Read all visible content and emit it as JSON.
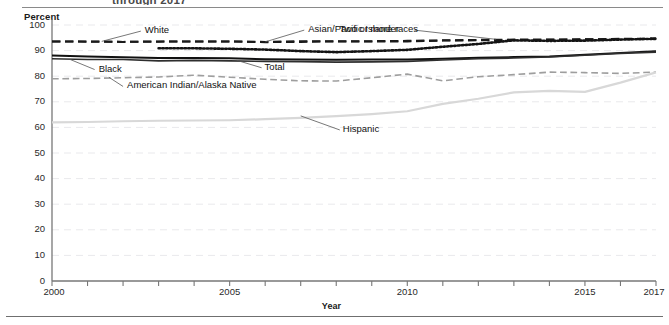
{
  "figure": {
    "title_partial": "through 2017",
    "top_rule": "horizontal-rule",
    "bottom_rule": "horizontal-rule"
  },
  "chart_data": {
    "type": "line",
    "title": "through 2017",
    "xlabel": "Year",
    "ylabel": "Percent",
    "ylim": [
      0,
      100
    ],
    "xlim": [
      2000,
      2017
    ],
    "ytick_labels": [
      "0",
      "10",
      "20",
      "30",
      "40",
      "50",
      "60",
      "70",
      "80",
      "90",
      "100"
    ],
    "ytick_values": [
      0,
      10,
      20,
      30,
      40,
      50,
      60,
      70,
      80,
      90,
      100
    ],
    "xtick_labels": [
      "2000",
      "2005",
      "2010",
      "2015",
      "2017"
    ],
    "xtick_values": [
      2000,
      2005,
      2010,
      2015,
      2017
    ],
    "x_minor_ticks": [
      2000,
      2001,
      2002,
      2003,
      2004,
      2005,
      2006,
      2007,
      2008,
      2009,
      2010,
      2011,
      2012,
      2013,
      2014,
      2015,
      2016,
      2017
    ],
    "grid": "horizontal-dashed-light",
    "legend_position": "inline-labels-with-leader-lines",
    "x": [
      2000,
      2001,
      2002,
      2003,
      2004,
      2005,
      2006,
      2007,
      2008,
      2009,
      2010,
      2011,
      2012,
      2013,
      2014,
      2015,
      2016,
      2017
    ],
    "series": [
      {
        "name": "Total",
        "style": "solid",
        "color": "#111111",
        "width": 1.9,
        "label_x": 2005.9,
        "label_y": 83.3,
        "leader_to": [
          2005.2,
          86.2
        ],
        "values": [
          88.1,
          87.7,
          87.4,
          87.1,
          87.1,
          87.0,
          86.6,
          86.5,
          86.4,
          86.5,
          86.5,
          86.8,
          87.2,
          87.5,
          87.7,
          88.4,
          89.1,
          89.8
        ]
      },
      {
        "name": "White",
        "style": "dashed",
        "color": "#1a1a1a",
        "width": 2.0,
        "label_x": 2002.5,
        "label_y": 97.6,
        "leader_to": [
          2001.4,
          93.6
        ],
        "values": [
          93.6,
          93.6,
          93.4,
          93.5,
          93.6,
          93.6,
          93.3,
          93.4,
          93.6,
          93.6,
          93.6,
          93.9,
          94.0,
          94.1,
          94.2,
          94.4,
          94.6,
          94.7
        ]
      },
      {
        "name": "Black",
        "style": "solid",
        "color": "#2e2e2e",
        "width": 1.6,
        "label_x": 2001.2,
        "label_y": 82.6,
        "leader_to": [
          2000.5,
          86.6
        ],
        "values": [
          86.8,
          86.5,
          86.5,
          86.0,
          86.2,
          86.0,
          85.8,
          85.7,
          85.5,
          85.6,
          85.8,
          86.3,
          86.8,
          87.1,
          87.5,
          88.2,
          88.9,
          89.4
        ]
      },
      {
        "name": "Asian/Pacific Islander",
        "style": "dashed",
        "color": "#1a1a1a",
        "width": 2.0,
        "label_x": 2007.1,
        "label_y": 98.0,
        "leader_to": [
          2006.0,
          93.4
        ],
        "values": [
          93.6,
          93.5,
          93.4,
          93.6,
          93.6,
          93.6,
          93.4,
          93.7,
          93.7,
          93.7,
          93.8,
          94.0,
          94.2,
          94.3,
          94.3,
          94.4,
          94.5,
          94.6
        ]
      },
      {
        "name": "American Indian/Alaska Native",
        "style": "dashed",
        "color": "#9e9e9e",
        "width": 1.6,
        "label_x": 2002.0,
        "label_y": 76.0,
        "leader_to": [
          2001.6,
          79.6
        ],
        "values": [
          79.0,
          79.1,
          79.4,
          79.7,
          80.4,
          79.6,
          78.8,
          78.2,
          78.1,
          79.4,
          80.8,
          78.2,
          79.8,
          80.6,
          81.6,
          81.4,
          81.1,
          81.6
        ]
      },
      {
        "name": "Two or more races",
        "style": "dotted",
        "color": "#141414",
        "width": 2.6,
        "label_x": 2010.2,
        "label_y": 98.0,
        "leader_to": [
          2012.5,
          94.4
        ],
        "values": [
          null,
          null,
          null,
          90.9,
          90.9,
          90.7,
          90.4,
          89.8,
          89.4,
          89.8,
          90.3,
          91.5,
          92.6,
          94.0,
          93.8,
          93.9,
          94.3,
          94.6
        ]
      },
      {
        "name": "Hispanic",
        "style": "solid",
        "color": "#d8d8d8",
        "width": 2.2,
        "label_x": 2008.1,
        "label_y": 59.0,
        "leader_to": [
          2007.0,
          64.5
        ],
        "values": [
          62.0,
          62.1,
          62.4,
          62.6,
          62.7,
          62.8,
          63.2,
          63.7,
          64.4,
          65.2,
          66.3,
          69.2,
          71.2,
          73.7,
          74.3,
          73.9,
          77.5,
          81.5
        ]
      }
    ]
  }
}
